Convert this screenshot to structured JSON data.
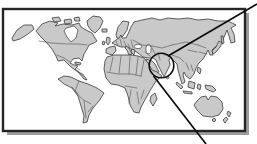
{
  "figure": {
    "kind": "world-locator-map",
    "description_of_visible_content": "Framed world map with a circled region over South Asia and two leader lines running to the top-right and bottom-right corners of the image"
  },
  "colors": {
    "ocean": "#ffffff",
    "land": "#c9c9c9",
    "coast": "#3a3a3a",
    "country-border": "#4f4f4f",
    "frame-border": "#252525",
    "frame-shadow": "#9e9e9e",
    "annotation": "#0d0d0d"
  },
  "frame": {
    "x": 3,
    "y": 9,
    "width": 242,
    "height": 122,
    "shadow_offset_x": 4,
    "shadow_offset_y": 4
  },
  "annotation": {
    "circle": {
      "cx": 161.5,
      "cy": 65.5,
      "r": 12.3,
      "stroke_width": 1.6
    },
    "leader_line_top": {
      "x1": 257,
      "y1": 4,
      "x2": 168,
      "y2": 56,
      "stroke_width": 1.7
    },
    "leader_line_bottom": {
      "x1": 153.5,
      "y1": 76,
      "x2": 206,
      "y2": 144,
      "stroke_width": 1.7
    }
  }
}
